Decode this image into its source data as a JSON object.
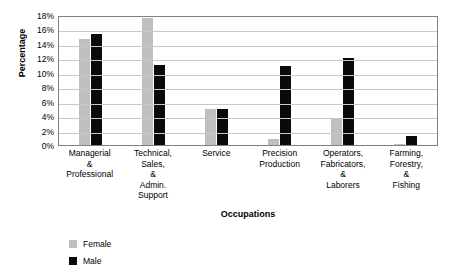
{
  "chart_data": {
    "type": "bar",
    "title": "",
    "xlabel": "Occupations",
    "ylabel": "Percentage",
    "ylim": [
      0,
      18
    ],
    "ytick_labels": [
      "18%",
      "16%",
      "14%",
      "12%",
      "10%",
      "8%",
      "6%",
      "4%",
      "2%",
      "0%"
    ],
    "ytick_values": [
      18,
      16,
      14,
      12,
      10,
      8,
      6,
      4,
      2,
      0
    ],
    "grid": true,
    "legend_position": "bottom-left",
    "categories": [
      "Managerial\n&\nProfessional",
      "Technical,\nSales,\n&\nAdmin.\nSupport",
      "Service",
      "Precision\nProduction",
      "Operators,\nFabricators,\n&\nLaborers",
      "Farming,\nForestry,\n&\nFishing"
    ],
    "series": [
      {
        "name": "Female",
        "color": "#bfbfbf",
        "values": [
          14.7,
          17.6,
          5.0,
          0.8,
          3.7,
          0.2
        ]
      },
      {
        "name": "Male",
        "color": "#0a0a0a",
        "values": [
          15.4,
          11.1,
          5.0,
          10.9,
          12.1,
          1.3
        ]
      }
    ]
  }
}
